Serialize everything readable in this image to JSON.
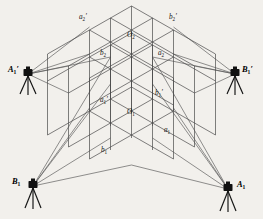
{
  "figure": {
    "type": "surveying-calibration-diagram",
    "background_color": "#f2f0ec",
    "line_color": "#4a4a4a",
    "instrument_color": "#111111"
  },
  "lattice": {
    "description": "2x2x2 isometric cubic grid of control points, two stacked layers",
    "layers": 2,
    "divisions_per_edge": 2,
    "origin_top": {
      "x": 131.5,
      "y": 57
    },
    "origin_bottom": {
      "x": 131.5,
      "y": 111
    },
    "axis_u": {
      "dx": 42,
      "dy": -24
    },
    "axis_v": {
      "dx": -42,
      "dy": -24
    },
    "axis_w": {
      "dx": 0,
      "dy": 27
    }
  },
  "nodes": [
    {
      "id": "a2p",
      "base": "a",
      "sub": "2",
      "prime": true,
      "label_x": 79,
      "label_y": 19,
      "px": 89.5,
      "py": 27
    },
    {
      "id": "O2",
      "base": "O",
      "sub": "2",
      "prime": false,
      "label_x": 127,
      "label_y": 37,
      "px": 131.5,
      "py": 30
    },
    {
      "id": "b2p",
      "base": "b",
      "sub": "2",
      "prime": true,
      "label_x": 169,
      "label_y": 19,
      "px": 173.5,
      "py": 27
    },
    {
      "id": "b2",
      "base": "b",
      "sub": "2",
      "prime": false,
      "label_x": 100,
      "label_y": 55,
      "px": 110.5,
      "py": 57
    },
    {
      "id": "a2",
      "base": "a",
      "sub": "2",
      "prime": false,
      "label_x": 158,
      "label_y": 55,
      "px": 152.5,
      "py": 57
    },
    {
      "id": "a1p",
      "base": "a",
      "sub": "1",
      "prime": true,
      "label_x": 100,
      "label_y": 102,
      "px": 110.5,
      "py": 84
    },
    {
      "id": "b1p",
      "base": "b",
      "sub": "1",
      "prime": true,
      "label_x": 155,
      "label_y": 95,
      "px": 152.5,
      "py": 84
    },
    {
      "id": "O1",
      "base": "O",
      "sub": "1",
      "prime": false,
      "label_x": 127,
      "label_y": 114,
      "px": 131.5,
      "py": 111
    },
    {
      "id": "b1",
      "base": "b",
      "sub": "1",
      "prime": false,
      "label_x": 101,
      "label_y": 152,
      "px": 110.5,
      "py": 138
    },
    {
      "id": "a1",
      "base": "a",
      "sub": "1",
      "prime": false,
      "label_x": 164,
      "label_y": 132,
      "px": 152.5,
      "py": 138
    }
  ],
  "stations": [
    {
      "id": "A1p",
      "base": "A",
      "sub": "1",
      "prime": true,
      "label_x": 10,
      "label_y": 70,
      "px": 28,
      "py": 74,
      "label_side": "left"
    },
    {
      "id": "B1p",
      "base": "B",
      "sub": "1",
      "prime": true,
      "label_x": 243,
      "label_y": 70,
      "px": 235,
      "py": 74,
      "label_side": "right"
    },
    {
      "id": "B1",
      "base": "B",
      "sub": "1",
      "prime": false,
      "label_x": 13,
      "label_y": 182,
      "px": 33,
      "py": 186,
      "label_side": "left"
    },
    {
      "id": "A1",
      "base": "A",
      "sub": "1",
      "prime": false,
      "label_x": 238,
      "label_y": 185,
      "px": 228,
      "py": 189,
      "label_side": "right"
    }
  ],
  "sight_lines": {
    "description": "Lines of sight from each theodolite station to lattice control points",
    "count": 16
  }
}
